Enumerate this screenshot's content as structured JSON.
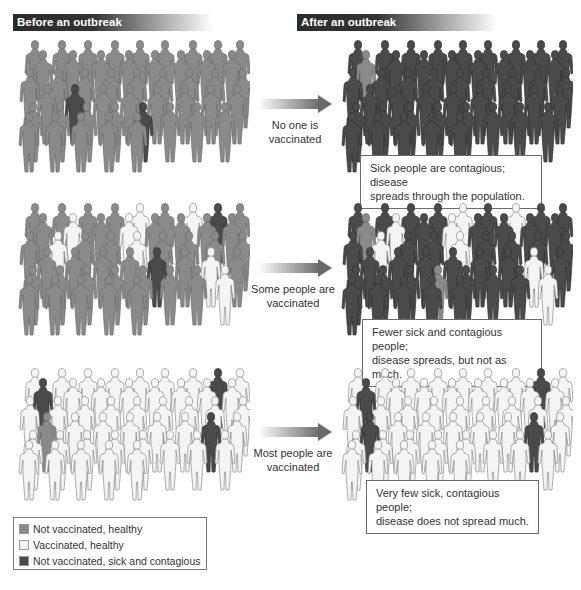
{
  "headers": {
    "before": "Before an outbreak",
    "after": "After an outbreak"
  },
  "colors": {
    "healthy_unvaccinated": "#8a8a8a",
    "vaccinated": "#f4f4f4",
    "sick": "#4a4a4a",
    "header_bg": "#2b2b2b",
    "outline": "#8c8c8c"
  },
  "rows": [
    {
      "arrow_label": "No one is vaccinated",
      "arrow_label_lines": [
        "No one is",
        "vaccinated"
      ],
      "callout_lines": [
        "Sick people are contagious; disease",
        "spreads through the population."
      ],
      "before_pattern": "HHHHHHHHHHHHHHHHHHHHHHHHHHHSHHHHHHHHHHSHHHHHHH",
      "after_pattern": "SSSSSSSSSHSSSSSSSSSSSSSSSSSSSSSSSSSSSSSSSSSSSS"
    },
    {
      "arrow_label": "Some people are vaccinated",
      "arrow_label_lines": [
        "Some people are",
        "vaccinated"
      ],
      "callout_lines": [
        "Fewer sick and contagious people;",
        "disease spreads, but not as much."
      ],
      "before_pattern": "HHHHVHVSHHVHVHHHHHVHHVHHHHHHHHSHVHHHHHHHHVHHHH",
      "after_pattern": "SSSSVSVSSHVSVSSSSSVSSVSSSSSSSSSSVSSSSHSSSVSSSS"
    },
    {
      "arrow_label": "Most people are vaccinated",
      "arrow_label_lines": [
        "Most people are",
        "vaccinated"
      ],
      "callout_lines": [
        "Very few sick, contagious people;",
        "disease does not spread much."
      ],
      "before_pattern": "VVVVVVVSVSVVVVVVVVVVVVVVVVHVVVVVSVVVVVVVVVVVVV",
      "after_pattern": "VVVVVVVSVSVVVVVVVVVVVVVVVVSVVVVVSVVVVVVVVVVVVV"
    }
  ],
  "legend": [
    {
      "key": "H",
      "label": "Not vaccinated, healthy",
      "color": "#8a8a8a"
    },
    {
      "key": "V",
      "label": "Vaccinated, healthy",
      "color": "#f4f4f4"
    },
    {
      "key": "S",
      "label": "Not vaccinated, sick and contagious",
      "color": "#4a4a4a"
    }
  ]
}
